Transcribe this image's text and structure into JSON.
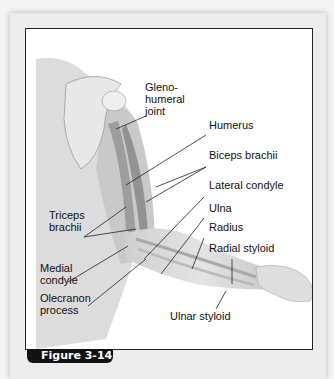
{
  "figure": {
    "caption_tab": "Figure 3-14",
    "tab_color": "#111111",
    "labels": {
      "glenohumeral": "Gleno-\nhumeral\njoint",
      "humerus": "Humerus",
      "biceps": "Biceps brachii",
      "lateral_condyle": "Lateral condyle",
      "ulna": "Ulna",
      "radius": "Radius",
      "radial_styloid": "Radial styloid",
      "triceps": "Triceps\nbrachii",
      "medial_condyle": "Medial\ncondyle",
      "olecranon": "Olecranon\nprocess",
      "ulnar_styloid": "Ulnar styloid"
    }
  }
}
